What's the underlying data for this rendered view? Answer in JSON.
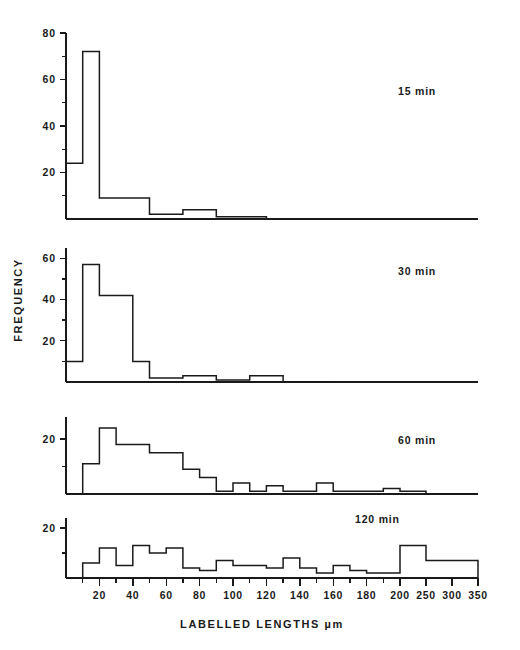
{
  "figure": {
    "axis_title_x": "LABELLED   LENGTHS µm",
    "axis_title_y": "FREQUENCY",
    "background": "#ffffff",
    "line_color": "#1a1a1a"
  },
  "x_axis": {
    "label": "LABELLED   LENGTHS µm",
    "tick_labels": [
      "20",
      "40",
      "60",
      "80",
      "100",
      "120",
      "140",
      "160",
      "180",
      "200",
      "250",
      "300",
      "350"
    ],
    "tick_values": [
      20,
      40,
      60,
      80,
      100,
      120,
      140,
      160,
      180,
      200,
      250,
      300,
      350
    ],
    "minor_tick_values": [
      10,
      30,
      50,
      70,
      90,
      110,
      130,
      150,
      170,
      190
    ],
    "range": [
      0,
      350
    ],
    "compressed_after": 200,
    "note": "linear 0-200, compressed scale 200-350"
  },
  "chart_data": {
    "type": "bar",
    "title": "",
    "xlabel": "LABELLED   LENGTHS µm",
    "ylabel": "FREQUENCY",
    "grid": false,
    "legend": "none",
    "panels": [
      {
        "label": "15 min",
        "ylim": [
          0,
          80
        ],
        "ytick_labels": [
          "20",
          "40",
          "60",
          "80"
        ],
        "ytick_values": [
          20,
          40,
          60,
          80
        ],
        "yminor_values": [
          10,
          30,
          50,
          70
        ],
        "bin_edges": [
          0,
          10,
          20,
          30,
          40,
          50,
          60,
          70,
          80,
          90,
          100,
          110,
          120
        ],
        "values": [
          24,
          72,
          9,
          9,
          9,
          2,
          2,
          4,
          4,
          1,
          1,
          1
        ]
      },
      {
        "label": "30 min",
        "ylim": [
          0,
          65
        ],
        "ytick_labels": [
          "20",
          "40",
          "60"
        ],
        "ytick_values": [
          20,
          40,
          60
        ],
        "yminor_values": [
          10,
          30,
          50
        ],
        "bin_edges": [
          0,
          10,
          20,
          30,
          40,
          50,
          60,
          70,
          80,
          90,
          100,
          110,
          120,
          130,
          140,
          150,
          160
        ],
        "values": [
          10,
          57,
          42,
          42,
          10,
          2,
          2,
          3,
          3,
          1,
          1,
          3,
          3,
          0,
          0,
          0
        ]
      },
      {
        "label": "60 min",
        "ylim": [
          0,
          28
        ],
        "ytick_labels": [
          "20"
        ],
        "ytick_values": [
          20
        ],
        "yminor_values": [
          10
        ],
        "bin_edges": [
          0,
          10,
          20,
          30,
          40,
          50,
          60,
          70,
          80,
          90,
          100,
          110,
          120,
          130,
          140,
          150,
          160,
          170,
          180,
          190,
          200,
          250,
          300,
          350
        ],
        "values": [
          0,
          11,
          24,
          18,
          18,
          15,
          15,
          9,
          6,
          1,
          4,
          1,
          3,
          1,
          1,
          4,
          1,
          1,
          1,
          2,
          1,
          0,
          0
        ]
      },
      {
        "label": "120 min",
        "ylim": [
          0,
          24
        ],
        "ytick_labels": [
          "20"
        ],
        "ytick_values": [
          20
        ],
        "yminor_values": [
          10
        ],
        "bin_edges": [
          0,
          10,
          20,
          30,
          40,
          50,
          60,
          70,
          80,
          90,
          100,
          110,
          120,
          130,
          140,
          150,
          160,
          170,
          180,
          190,
          200,
          250,
          300,
          350
        ],
        "values": [
          0,
          6,
          12,
          5,
          13,
          10,
          12,
          4,
          3,
          7,
          5,
          5,
          4,
          8,
          4,
          2,
          5,
          3,
          2,
          2,
          13,
          7,
          7
        ]
      }
    ]
  }
}
